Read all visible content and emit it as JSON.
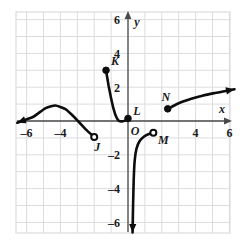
{
  "figure": {
    "kind": "coordinate-plane-graph",
    "background": "#ffffff",
    "grid_color": "#dcdce0",
    "curve_color": "#0d0d0d",
    "axis_color": "#4a4a4a",
    "label_color": "#1a1a1a"
  },
  "axes": {
    "x_label": "x",
    "y_label": "y",
    "origin_label": "O",
    "x_range": [
      -7.0,
      6.3
    ],
    "y_range": [
      -7.0,
      7.0
    ],
    "x_ticks": [
      {
        "value": -6,
        "label": "–6"
      },
      {
        "value": -4,
        "label": "–4"
      },
      {
        "value": 4,
        "label": "4"
      },
      {
        "value": 6,
        "label": "6"
      }
    ],
    "y_ticks": [
      {
        "value": 6,
        "label": "6"
      },
      {
        "value": 4,
        "label": "4"
      },
      {
        "value": 2,
        "label": "2"
      },
      {
        "value": -2,
        "label": "–2"
      },
      {
        "value": -4,
        "label": "–4"
      },
      {
        "value": -6,
        "label": "–6"
      }
    ],
    "grid_step": 1
  },
  "points": [
    {
      "name": "J",
      "label": "J",
      "x": -2.0,
      "y": -0.95,
      "type": "open"
    },
    {
      "name": "K",
      "label": "K",
      "x": -1.3,
      "y": 3.0,
      "type": "filled"
    },
    {
      "name": "L",
      "label": "L",
      "x": 0.0,
      "y": 0.15,
      "type": "filled"
    },
    {
      "name": "M",
      "label": "M",
      "x": 1.5,
      "y": -0.7,
      "type": "open"
    },
    {
      "name": "N",
      "label": "N",
      "x": 2.35,
      "y": 0.72,
      "type": "filled"
    }
  ],
  "chart_data": {
    "type": "line",
    "title": "",
    "xlabel": "x",
    "ylabel": "y",
    "xlim": [
      -7.0,
      6.3
    ],
    "ylim": [
      -7.0,
      7.0
    ],
    "grid": true,
    "legend": "none",
    "series": [
      {
        "name": "branch-J",
        "description": "Hump-shaped branch entering from the left with an arrow, peaking near x = -4.3, ending at open circle J(-2, -0.95).",
        "start_marker": "arrow-left",
        "end_marker": "open-circle",
        "points": [
          [
            -6.55,
            -0.1
          ],
          [
            -5.6,
            0.25
          ],
          [
            -4.9,
            0.75
          ],
          [
            -4.3,
            0.92
          ],
          [
            -3.7,
            0.7
          ],
          [
            -3.1,
            0.15
          ],
          [
            -2.5,
            -0.5
          ],
          [
            -2.0,
            -0.95
          ]
        ]
      },
      {
        "name": "branch-K-L",
        "description": "Decreasing branch from filled point K(-1.3, 3) falling to a flat minimum near x = -0.55 then rising slightly to filled point L(0, 0.15).",
        "start_marker": "filled-circle",
        "end_marker": "filled-circle",
        "points": [
          [
            -1.3,
            3.0
          ],
          [
            -1.15,
            2.1
          ],
          [
            -1.0,
            1.35
          ],
          [
            -0.85,
            0.7
          ],
          [
            -0.7,
            0.25
          ],
          [
            -0.55,
            0.02
          ],
          [
            -0.35,
            -0.02
          ],
          [
            -0.15,
            0.04
          ],
          [
            0.0,
            0.15
          ]
        ]
      },
      {
        "name": "branch-M",
        "description": "Steep branch rising from a downward arrow near x = 0.28 below y = -6.5, bending right to open circle M(1.5, -0.7).",
        "start_marker": "arrow-down",
        "end_marker": "open-circle",
        "points": [
          [
            0.27,
            -6.6
          ],
          [
            0.3,
            -5.0
          ],
          [
            0.34,
            -3.4
          ],
          [
            0.4,
            -2.3
          ],
          [
            0.5,
            -1.65
          ],
          [
            0.68,
            -1.2
          ],
          [
            0.95,
            -0.92
          ],
          [
            1.2,
            -0.78
          ],
          [
            1.5,
            -0.7
          ]
        ]
      },
      {
        "name": "branch-N",
        "description": "Gently increasing branch from filled point N(2.35, 0.72) rising to an arrow at the upper right near (6.3, 1.85).",
        "start_marker": "filled-circle",
        "end_marker": "arrow-right",
        "points": [
          [
            2.35,
            0.72
          ],
          [
            3.0,
            1.05
          ],
          [
            3.7,
            1.3
          ],
          [
            4.4,
            1.5
          ],
          [
            5.1,
            1.65
          ],
          [
            5.7,
            1.76
          ],
          [
            6.3,
            1.88
          ]
        ]
      }
    ]
  }
}
